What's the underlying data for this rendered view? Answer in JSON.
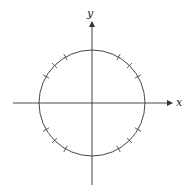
{
  "diagram": {
    "type": "unit-circle",
    "axes": {
      "x_label": "x",
      "y_label": "y"
    },
    "center": [
      92,
      103
    ],
    "radius": 53,
    "tick_angles_deg": [
      30,
      45,
      60,
      120,
      135,
      150,
      210,
      225,
      240,
      300,
      315,
      330
    ],
    "colors": {
      "stroke": "#333333",
      "background": "#ffffff"
    }
  }
}
